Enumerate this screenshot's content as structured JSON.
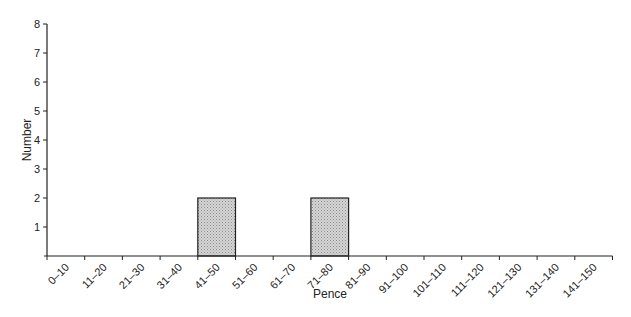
{
  "chart_data": {
    "type": "bar",
    "title": "",
    "xlabel": "Pence",
    "ylabel": "Number",
    "categories": [
      "0–10",
      "11–20",
      "21–30",
      "31–40",
      "41–50",
      "51–60",
      "61–70",
      "71–80",
      "81–90",
      "91–100",
      "101–110",
      "111–120",
      "121–130",
      "131–140",
      "141–150"
    ],
    "values": [
      0,
      0,
      0,
      0,
      2,
      0,
      0,
      2,
      0,
      0,
      0,
      0,
      0,
      0,
      0
    ],
    "ylim": [
      0,
      8
    ],
    "yticks": [
      1,
      2,
      3,
      4,
      5,
      6,
      7,
      8
    ],
    "grid": false,
    "legend": null,
    "bar_fill": "#c8c8c8",
    "bar_stroke": "#222222"
  }
}
